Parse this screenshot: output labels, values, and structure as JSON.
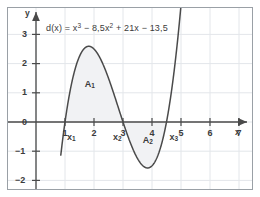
{
  "chart_data": {
    "type": "line",
    "title": "",
    "equation_label": "d(x) = x³ − 8,5x² + 21x − 13,5",
    "equation_parts": {
      "fn": "d(x) = x",
      "exp1": "3",
      "term2": " − 8,5x",
      "exp2": "2",
      "term3": " + 21x − 13,5"
    },
    "function": "x^3 - 8.5x^2 + 21x - 13.5",
    "coefficients": {
      "a": 1,
      "b": -8.5,
      "c": 21,
      "d": -13.5
    },
    "xlabel": "x",
    "ylabel": "y",
    "xlim": [
      -0.35,
      7.7
    ],
    "ylim": [
      -2.35,
      3.45
    ],
    "xticks": [
      1,
      2,
      3,
      4,
      5,
      6,
      7
    ],
    "yticks": [
      3,
      2,
      1,
      0,
      -1,
      -2
    ],
    "xtick_labels": [
      "1",
      "2",
      "3",
      "4",
      "5",
      "6",
      "7"
    ],
    "ytick_labels": [
      "3",
      "2",
      "1",
      "0",
      "−1",
      "−2"
    ],
    "grid": true,
    "grid_spacing": 1,
    "legend": "none",
    "roots": [
      {
        "name": "x₁",
        "label_main": "x",
        "label_sub": "1",
        "x": 1.0,
        "y": 0
      },
      {
        "name": "x₂",
        "label_main": "x",
        "label_sub": "2",
        "x": 3.0,
        "y": 0
      },
      {
        "name": "x₃",
        "label_main": "x",
        "label_sub": "3",
        "x": 4.5,
        "y": 0
      }
    ],
    "extrema": [
      {
        "type": "maximum",
        "x": 1.807,
        "y": 2.55
      },
      {
        "type": "minimum",
        "x": 3.86,
        "y": -1.52
      }
    ],
    "shaded_regions": [
      {
        "name": "A₁",
        "label_main": "A",
        "label_sub": "1",
        "from_x": 1.0,
        "to_x": 3.0,
        "position": "above-axis",
        "label_x": 1.85,
        "label_y": 1.3
      },
      {
        "name": "A₂",
        "label_main": "A",
        "label_sub": "2",
        "from_x": 3.0,
        "to_x": 4.5,
        "position": "below-axis",
        "label_x": 3.85,
        "label_y": -0.62
      }
    ],
    "curve_domain": [
      0.855,
      5.07
    ],
    "colors": {
      "curve": "#4a4a4a",
      "axis": "#4a4a4a",
      "grid": "#e3e6ea",
      "fill": "#f1f2f4",
      "text": "#3b3b3b",
      "border": "#9aa0a6",
      "background": "#ffffff"
    }
  }
}
